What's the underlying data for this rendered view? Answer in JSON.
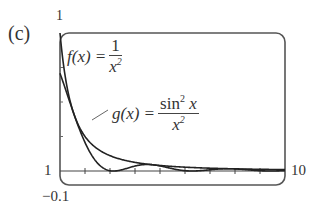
{
  "panel": {
    "label": "(c)"
  },
  "axes": {
    "ymax_label": "1",
    "ymin_label": "−0.1",
    "xmin_label": "1",
    "xmax_label": "10"
  },
  "annotations": {
    "f": {
      "lhs": "f(x) =",
      "num": "1",
      "den_base": "x",
      "den_exp": "2"
    },
    "g": {
      "lhs": "g(x) =",
      "num_base": "sin",
      "num_exp": "2",
      "num_arg": " x",
      "den_base": "x",
      "den_exp": "2"
    }
  },
  "colors": {
    "curve": "#222222",
    "frame": "#555555",
    "axis": "#444444",
    "text": "#333333"
  },
  "chart_data": {
    "type": "line",
    "title": "(c)",
    "xlabel": "",
    "ylabel": "",
    "xlim": [
      1,
      10
    ],
    "ylim": [
      -0.1,
      1
    ],
    "x_ticks": [
      1,
      2,
      3,
      4,
      5,
      6,
      7,
      8,
      9,
      10
    ],
    "grid": false,
    "legend": "inline annotations",
    "series": [
      {
        "name": "f(x) = 1/x^2",
        "x": [
          1,
          1.5,
          2,
          2.5,
          3,
          4,
          5,
          6,
          7,
          8,
          9,
          10
        ],
        "values": [
          1.0,
          0.444,
          0.25,
          0.16,
          0.111,
          0.0625,
          0.04,
          0.0278,
          0.0204,
          0.0156,
          0.0123,
          0.01
        ]
      },
      {
        "name": "g(x) = sin^2(x)/x^2",
        "x": [
          1,
          1.5,
          2,
          2.5,
          3,
          3.14,
          4,
          4.5,
          5,
          6,
          6.28,
          7,
          8,
          9,
          10
        ],
        "values": [
          0.708,
          0.442,
          0.207,
          0.057,
          0.0022,
          0.0,
          0.036,
          0.048,
          0.037,
          0.0022,
          0.0,
          0.0088,
          0.0153,
          0.0021,
          0.003
        ]
      }
    ]
  }
}
